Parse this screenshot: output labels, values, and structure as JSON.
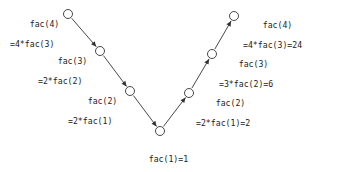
{
  "diagram": {
    "type": "call-trace-v-diagram",
    "stroke_color": "#333333",
    "text_color": "#1a1a1a",
    "background_color": "#ffffff",
    "node_radius": 4.5,
    "nodes": [
      {
        "id": "fac4-down",
        "cx": 68,
        "cy": 14,
        "label_line1": "fac(4)",
        "label_line2": "=4*fac(3)",
        "label_x": 10,
        "label_y": 9,
        "label_align": "right-of-text"
      },
      {
        "id": "fac3-down",
        "cx": 100,
        "cy": 51,
        "label_line1": "fac(3)",
        "label_line2": "=2*fac(2)",
        "label_x": 38,
        "label_y": 46,
        "label_align": "right-of-text"
      },
      {
        "id": "fac2-down",
        "cx": 130,
        "cy": 91,
        "label_line1": "fac(2)",
        "label_line2": "=2*fac(1)",
        "label_x": 68,
        "label_y": 86,
        "label_align": "right-of-text"
      },
      {
        "id": "fac1-base",
        "cx": 160,
        "cy": 131,
        "label_line1": "fac(1)=1",
        "label_line2": "",
        "label_x": 129,
        "label_y": 144,
        "label_align": "below"
      },
      {
        "id": "fac2-up",
        "cx": 189,
        "cy": 93,
        "label_line1": "fac(2)",
        "label_line2": "=2*fac(1)=2",
        "label_x": 196,
        "label_y": 88,
        "label_align": "left-of-text"
      },
      {
        "id": "fac3-up",
        "cx": 212,
        "cy": 54,
        "label_line1": "fac(3)",
        "label_line2": "=3*fac(2)=6",
        "label_x": 219,
        "label_y": 49,
        "label_align": "left-of-text"
      },
      {
        "id": "fac4-up",
        "cx": 234,
        "cy": 16,
        "label_line1": "fac(4)",
        "label_line2": "=4*fac(3)=24",
        "label_x": 243,
        "label_y": 10,
        "label_align": "left-of-text"
      }
    ],
    "edges": [
      {
        "id": "edge-fac4-to-fac3",
        "from": "fac4-down",
        "to": "fac3-down",
        "direction": "down"
      },
      {
        "id": "edge-fac3-to-fac2",
        "from": "fac3-down",
        "to": "fac2-down",
        "direction": "down"
      },
      {
        "id": "edge-fac2-to-fac1",
        "from": "fac2-down",
        "to": "fac1-base",
        "direction": "down"
      },
      {
        "id": "edge-fac1-to-fac2",
        "from": "fac1-base",
        "to": "fac2-up",
        "direction": "up"
      },
      {
        "id": "edge-fac2-to-fac3",
        "from": "fac2-up",
        "to": "fac3-up",
        "direction": "up"
      },
      {
        "id": "edge-fac3-to-fac4",
        "from": "fac3-up",
        "to": "fac4-up",
        "direction": "up"
      }
    ]
  }
}
